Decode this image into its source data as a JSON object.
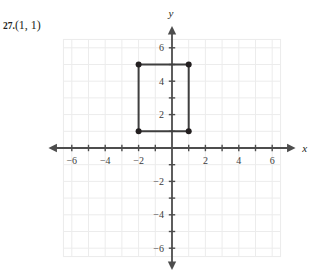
{
  "problem": {
    "number": "27.",
    "point": "(1, 1)"
  },
  "chart_data": {
    "type": "scatter",
    "title": "",
    "xlabel": "x",
    "ylabel": "y",
    "xlim": [
      -7,
      7
    ],
    "ylim": [
      -7,
      7
    ],
    "grid": true,
    "grid_range": [
      -6.5,
      6.5
    ],
    "legend": "none",
    "xticks": [
      -6,
      -4,
      -2,
      2,
      4,
      6
    ],
    "yticks": [
      6,
      4,
      2,
      -2,
      -4,
      -6
    ],
    "xtick_labels": [
      "−6",
      "−4",
      "−2",
      "2",
      "4",
      "6"
    ],
    "ytick_labels": [
      "6",
      "4",
      "2",
      "−2",
      "−4",
      "−6"
    ],
    "minor_tick_interval": 1,
    "shapes": [
      {
        "name": "rectangle",
        "type": "polygon",
        "closed": true,
        "vertices": [
          [
            -2,
            5
          ],
          [
            1,
            5
          ],
          [
            1,
            1
          ],
          [
            -2,
            1
          ]
        ],
        "stroke": "#3f3f3f",
        "stroke_width": 2,
        "fill": "none",
        "vertex_markers": true,
        "marker_radius": 3,
        "marker_color": "#231f20"
      }
    ],
    "axis_color": "#4d4d4d",
    "grid_color": "#ececec",
    "tick_color": "#4d4d4d"
  }
}
